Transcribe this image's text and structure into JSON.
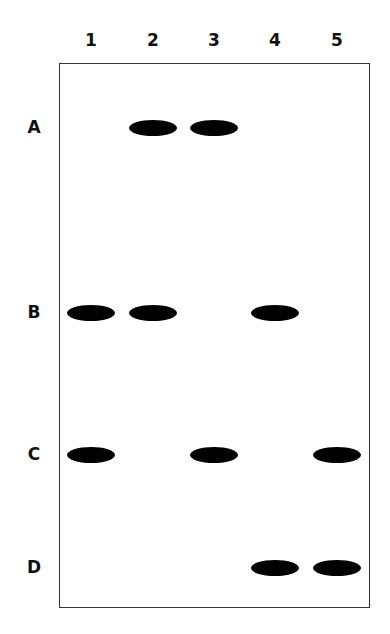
{
  "lanes": [
    {
      "label": "1",
      "x": 91
    },
    {
      "label": "2",
      "x": 153
    },
    {
      "label": "3",
      "x": 214
    },
    {
      "label": "4",
      "x": 275
    },
    {
      "label": "5",
      "x": 337
    }
  ],
  "rows": [
    {
      "label": "A",
      "y": 128
    },
    {
      "label": "B",
      "y": 313
    },
    {
      "label": "C",
      "y": 455
    },
    {
      "label": "D",
      "y": 568
    }
  ],
  "bands": [
    {
      "row": "A",
      "lane": "2"
    },
    {
      "row": "A",
      "lane": "3"
    },
    {
      "row": "B",
      "lane": "1"
    },
    {
      "row": "B",
      "lane": "2"
    },
    {
      "row": "B",
      "lane": "4"
    },
    {
      "row": "C",
      "lane": "1"
    },
    {
      "row": "C",
      "lane": "3"
    },
    {
      "row": "C",
      "lane": "5"
    },
    {
      "row": "D",
      "lane": "4"
    },
    {
      "row": "D",
      "lane": "5"
    }
  ],
  "colors": {
    "band": "#000000",
    "border": "#333333",
    "background": "#ffffff"
  }
}
